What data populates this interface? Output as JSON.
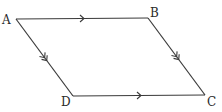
{
  "diagram": {
    "type": "parallelogram",
    "vertices": [
      {
        "id": "A",
        "label": "A",
        "x": 16,
        "y": 19,
        "lx": 2,
        "ly": 24
      },
      {
        "id": "B",
        "label": "B",
        "x": 148,
        "y": 18,
        "lx": 150,
        "ly": 17
      },
      {
        "id": "C",
        "label": "C",
        "x": 205,
        "y": 95,
        "lx": 207,
        "ly": 106
      },
      {
        "id": "D",
        "label": "D",
        "x": 73,
        "y": 96,
        "lx": 61,
        "ly": 106
      }
    ],
    "edges": [
      {
        "from": "A",
        "to": "B",
        "arrows": 1
      },
      {
        "from": "B",
        "to": "C",
        "arrows": 2
      },
      {
        "from": "D",
        "to": "C",
        "arrows": 1
      },
      {
        "from": "A",
        "to": "D",
        "arrows": 2
      }
    ],
    "stroke_color": "#3a3a3a",
    "label_color": "#2a2a2a"
  }
}
